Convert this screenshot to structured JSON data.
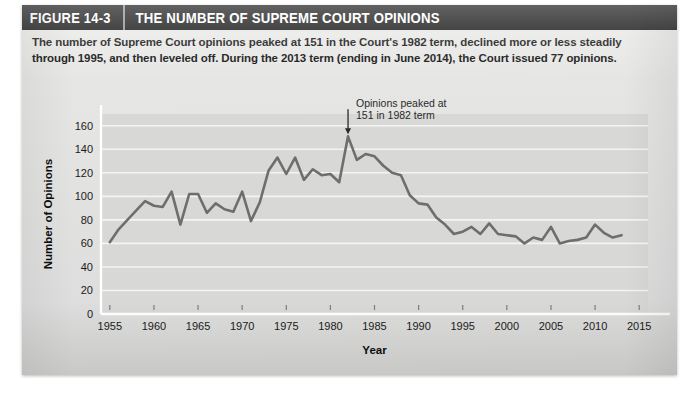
{
  "figure": {
    "number": "FIGURE 14-3",
    "title": "THE NUMBER OF SUPREME COURT OPINIONS",
    "caption_line_1": "The number of Supreme Court opinions peaked at 151 in the Court's 1982 term, declined more or less steadily",
    "caption_line_2": "through 1995, and then leveled off. During the 2013 term (ending in June 2014), the Court issued 77 opinions."
  },
  "colors": {
    "header_background": "#0d0d0d",
    "header_text": "#ffffff",
    "header_divider": "#8d8d8d",
    "paper_background": "#e4e4e2",
    "plot_background": "#d8d8d6",
    "gridline": "#f4f4f4",
    "series_line": "#6e6e6e",
    "axis": "#ffffff",
    "tick_label": "#1a1a1a"
  },
  "chart_data": {
    "type": "line",
    "title": "THE NUMBER OF SUPREME COURT OPINIONS",
    "xlabel": "Year",
    "ylabel": "Number of Opinions",
    "xlim": [
      1954,
      2016
    ],
    "ylim": [
      0,
      170
    ],
    "ytick_values": [
      0,
      20,
      40,
      60,
      80,
      100,
      120,
      140,
      160
    ],
    "ytick_labels": [
      "0",
      "20",
      "40",
      "60",
      "80",
      "100",
      "120",
      "140",
      "160"
    ],
    "xtick_values": [
      1955,
      1960,
      1965,
      1970,
      1975,
      1980,
      1985,
      1990,
      1995,
      2000,
      2005,
      2010,
      2015
    ],
    "xtick_labels": [
      "1955",
      "1960",
      "1965",
      "1970",
      "1975",
      "1980",
      "1985",
      "1990",
      "1995",
      "2000",
      "2005",
      "2010",
      "2015"
    ],
    "grid": "horizontal",
    "legend": "none",
    "series": [
      {
        "name": "Number of Opinions",
        "x": [
          1955,
          1956,
          1957,
          1958,
          1959,
          1960,
          1961,
          1962,
          1963,
          1964,
          1965,
          1966,
          1967,
          1968,
          1969,
          1970,
          1971,
          1972,
          1973,
          1974,
          1975,
          1976,
          1977,
          1978,
          1979,
          1980,
          1981,
          1982,
          1983,
          1984,
          1985,
          1986,
          1987,
          1988,
          1989,
          1990,
          1991,
          1992,
          1993,
          1994,
          1995,
          1996,
          1997,
          1998,
          1999,
          2000,
          2001,
          2002,
          2003,
          2004,
          2005,
          2006,
          2007,
          2008,
          2009,
          2010,
          2011,
          2012,
          2013
        ],
        "values": [
          61,
          72,
          80,
          88,
          96,
          92,
          91,
          104,
          76,
          102,
          102,
          86,
          94,
          89,
          87,
          104,
          79,
          95,
          122,
          133,
          119,
          133,
          114,
          123,
          118,
          119,
          112,
          151,
          131,
          136,
          134,
          126,
          120,
          118,
          101,
          94,
          93,
          82,
          76,
          68,
          70,
          74,
          68,
          77,
          68,
          67,
          66,
          60,
          65,
          63,
          74,
          60,
          62,
          63,
          65,
          76,
          69,
          65,
          67
        ],
        "color": "#6e6e6e",
        "line_width": 2.6
      }
    ],
    "annotations": [
      {
        "text_line_1": "Opinions peaked at",
        "text_line_2": "151 in 1982 term",
        "points_to_year": 1982,
        "points_to_value": 151,
        "arrow": "down"
      }
    ]
  }
}
